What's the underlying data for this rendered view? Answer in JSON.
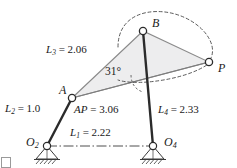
{
  "figure": {
    "type": "mechanism-diagram",
    "colors": {
      "link_dark": "#2b2b2b",
      "line_gray": "#6e6e6e",
      "coupler_fill": "#ececed",
      "dashed": "#4a4a4a",
      "ground_hatch": "#3a3a3a",
      "corner_mark": "#9a9a9a"
    },
    "points": [
      {
        "id": "O2",
        "label": "O",
        "sub": "2",
        "x": 47,
        "y": 146,
        "label_x": 26,
        "label_y": 136
      },
      {
        "id": "A",
        "label": "A",
        "sub": "",
        "x": 72,
        "y": 98,
        "label_x": 59,
        "label_y": 85
      },
      {
        "id": "B",
        "label": "B",
        "sub": "",
        "x": 143,
        "y": 31,
        "label_x": 152,
        "label_y": 18
      },
      {
        "id": "O4",
        "label": "O",
        "sub": "4",
        "x": 153,
        "y": 146,
        "label_x": 164,
        "label_y": 136
      },
      {
        "id": "P",
        "label": "P",
        "sub": "",
        "x": 209,
        "y": 62,
        "label_x": 218,
        "label_y": 63
      }
    ],
    "dimensions": [
      {
        "id": "L3",
        "sym": "L",
        "sub": "3",
        "value": "2.06",
        "text": "L_3 = 2.06",
        "x": 46,
        "y": 44
      },
      {
        "id": "L2",
        "sym": "L",
        "sub": "2",
        "value": "1.0",
        "text": "L_2 = 1.0",
        "x": 5,
        "y": 103
      },
      {
        "id": "AP",
        "sym": "AP",
        "sub": "",
        "value": "3.06",
        "text": "AP = 3.06",
        "x": 74,
        "y": 104
      },
      {
        "id": "L4",
        "sym": "L",
        "sub": "4",
        "value": "2.33",
        "text": "L_4 = 2.33",
        "x": 158,
        "y": 104
      },
      {
        "id": "L1",
        "sym": "L",
        "sub": "1",
        "value": "2.22",
        "text": "L_1 = 2.22",
        "x": 70,
        "y": 128
      }
    ],
    "angle": {
      "id": "angle-BAP",
      "text": "31°",
      "x": 105,
      "y": 67
    }
  }
}
